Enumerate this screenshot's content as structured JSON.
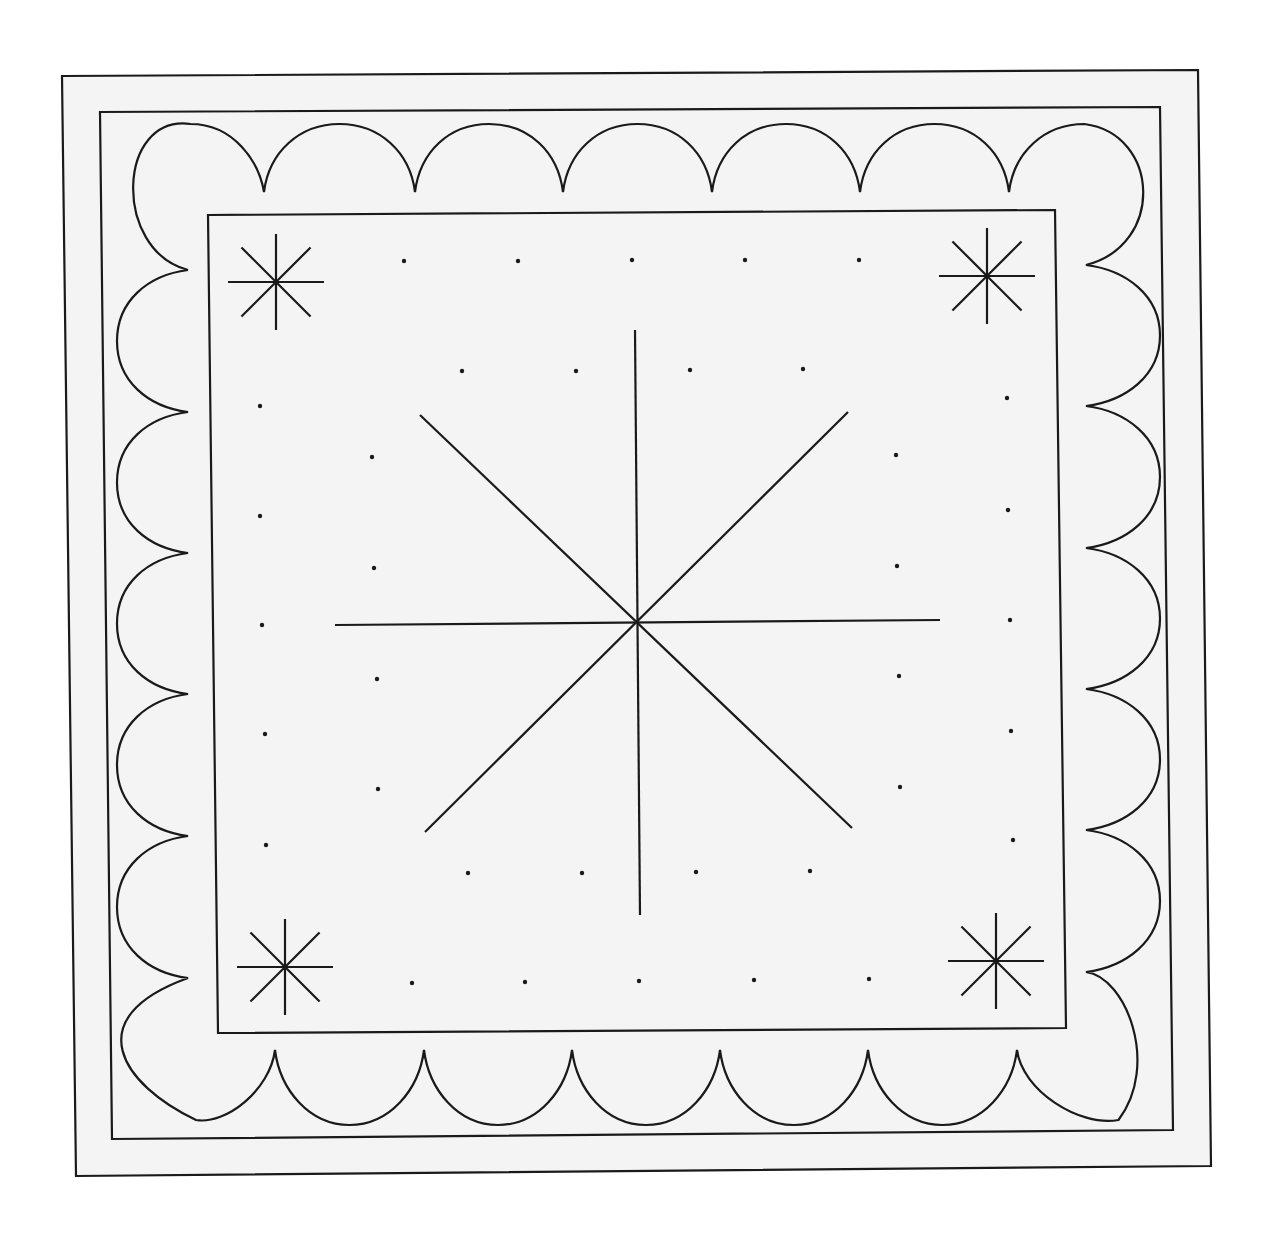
{
  "canvas": {
    "width": 1273,
    "height": 1233,
    "background": "#ffffff",
    "paper": "#f4f4f4",
    "ink": "#1a1a1a"
  },
  "frames": {
    "outer": [
      [
        62,
        76
      ],
      [
        1198,
        70
      ],
      [
        1211,
        1166
      ],
      [
        76,
        1176
      ]
    ],
    "border": [
      [
        100,
        112
      ],
      [
        1160,
        107
      ],
      [
        1173,
        1130
      ],
      [
        112,
        1139
      ]
    ],
    "inner": [
      [
        208,
        215
      ],
      [
        1055,
        210
      ],
      [
        1066,
        1028
      ],
      [
        218,
        1033
      ]
    ]
  },
  "scallops": {
    "top": {
      "cusps_x": [
        264,
        415,
        563,
        712,
        860,
        1009
      ],
      "cusp_y": 192,
      "arc_y": 124,
      "ends": [
        [
          120,
          210
        ],
        [
          1155,
          200
        ]
      ]
    },
    "bottom": {
      "cusps_x": [
        275,
        424,
        572,
        720,
        868,
        1017
      ],
      "cusp_y": 1050,
      "arc_y": 1125,
      "ends": [
        [
          130,
          1030
        ],
        [
          1165,
          1020
        ]
      ]
    },
    "left": {
      "cusps_y": [
        270,
        412,
        553,
        694,
        836,
        978
      ],
      "cusp_x": 188,
      "arc_x": 117
    },
    "right": {
      "cusps_y": [
        265,
        406,
        548,
        689,
        830,
        972
      ],
      "cusp_x": 1086,
      "arc_x": 1160
    }
  },
  "center_star": {
    "center": [
      637,
      623
    ],
    "lines": [
      [
        [
          635,
          330
        ],
        [
          640,
          915
        ]
      ],
      [
        [
          335,
          625
        ],
        [
          940,
          620
        ]
      ],
      [
        [
          420,
          415
        ],
        [
          852,
          828
        ]
      ],
      [
        [
          848,
          412
        ],
        [
          425,
          832
        ]
      ]
    ]
  },
  "corner_stars": [
    {
      "name": "top-left",
      "center": [
        276,
        282
      ],
      "r": 48
    },
    {
      "name": "top-right",
      "center": [
        987,
        276
      ],
      "r": 48
    },
    {
      "name": "bottom-left",
      "center": [
        285,
        967
      ],
      "r": 48
    },
    {
      "name": "bottom-right",
      "center": [
        996,
        961
      ],
      "r": 48
    }
  ],
  "dots": [
    [
      404,
      261
    ],
    [
      518,
      261
    ],
    [
      632,
      260
    ],
    [
      745,
      260
    ],
    [
      859,
      260
    ],
    [
      462,
      371
    ],
    [
      576,
      371
    ],
    [
      690,
      370
    ],
    [
      803,
      369
    ],
    [
      260,
      406
    ],
    [
      372,
      457
    ],
    [
      260,
      516
    ],
    [
      374,
      568
    ],
    [
      262,
      625
    ],
    [
      377,
      679
    ],
    [
      265,
      734
    ],
    [
      378,
      789
    ],
    [
      266,
      845
    ],
    [
      1007,
      398
    ],
    [
      896,
      455
    ],
    [
      1008,
      510
    ],
    [
      897,
      566
    ],
    [
      1010,
      620
    ],
    [
      899,
      676
    ],
    [
      1011,
      731
    ],
    [
      900,
      787
    ],
    [
      1013,
      840
    ],
    [
      468,
      873
    ],
    [
      582,
      873
    ],
    [
      696,
      872
    ],
    [
      810,
      871
    ],
    [
      412,
      983
    ],
    [
      525,
      982
    ],
    [
      639,
      981
    ],
    [
      754,
      980
    ],
    [
      869,
      979
    ]
  ],
  "stroke": {
    "frame_width": 2.2,
    "line_width": 2.2,
    "dot_radius": 2.2
  }
}
